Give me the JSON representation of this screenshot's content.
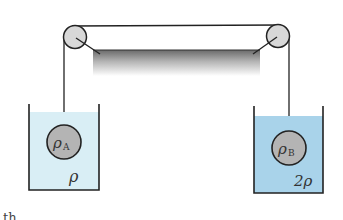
{
  "diagram": {
    "ceiling": {
      "label": ""
    },
    "pulleys": [
      {
        "id": "left-pulley"
      },
      {
        "id": "right-pulley"
      }
    ],
    "sphere_a": {
      "symbol": "ρ",
      "subscript": "A"
    },
    "sphere_b": {
      "symbol": "ρ",
      "subscript": "B"
    },
    "container_a": {
      "liquid_density_label": "ρ",
      "liquid_color": "#d9eef5"
    },
    "container_b": {
      "liquid_density_label": "2ρ",
      "liquid_color": "#a9d3ea"
    },
    "colors": {
      "line": "#222222",
      "pulley_fill": "#d8d8d8",
      "sphere_fill": "#b4b4b4",
      "ceiling_gradient_top": "#6a6a6a",
      "ceiling_gradient_bottom": "#ffffff"
    },
    "cropped_text": "th"
  }
}
